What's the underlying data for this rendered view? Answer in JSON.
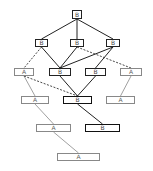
{
  "diagram": {
    "type": "lattice",
    "nodes": [
      {
        "id": "n0",
        "label": "B",
        "kind": "b",
        "x": 72,
        "y": 10,
        "w": 10,
        "h": 9
      },
      {
        "id": "n1",
        "label": "B",
        "kind": "b",
        "x": 35,
        "y": 39,
        "w": 13,
        "h": 8
      },
      {
        "id": "n2",
        "label": "B",
        "kind": "b",
        "x": 70,
        "y": 39,
        "w": 14,
        "h": 8
      },
      {
        "id": "n3",
        "label": "B",
        "kind": "b",
        "x": 106,
        "y": 39,
        "w": 14,
        "h": 8
      },
      {
        "id": "n4",
        "label": "A",
        "kind": "a",
        "x": 14,
        "y": 68,
        "w": 20,
        "h": 8
      },
      {
        "id": "n5",
        "label": "B",
        "kind": "b",
        "x": 49,
        "y": 68,
        "w": 22,
        "h": 8
      },
      {
        "id": "n6",
        "label": "B",
        "kind": "b",
        "x": 85,
        "y": 68,
        "w": 21,
        "h": 8
      },
      {
        "id": "n7",
        "label": "A",
        "kind": "a",
        "x": 120,
        "y": 68,
        "w": 22,
        "h": 8
      },
      {
        "id": "n8",
        "label": "A",
        "kind": "a",
        "x": 21,
        "y": 96,
        "w": 28,
        "h": 8
      },
      {
        "id": "n9",
        "label": "B",
        "kind": "b-bold",
        "x": 63,
        "y": 96,
        "w": 29,
        "h": 8
      },
      {
        "id": "n10",
        "label": "A",
        "kind": "a",
        "x": 106,
        "y": 96,
        "w": 29,
        "h": 8
      },
      {
        "id": "n11",
        "label": "A",
        "kind": "a",
        "x": 36,
        "y": 124,
        "w": 35,
        "h": 8
      },
      {
        "id": "n12",
        "label": "B",
        "kind": "b-bold",
        "x": 85,
        "y": 124,
        "w": 35,
        "h": 8
      },
      {
        "id": "n13",
        "label": "A",
        "kind": "a",
        "x": 57,
        "y": 153,
        "w": 43,
        "h": 8
      }
    ],
    "edges": [
      {
        "from": "n0",
        "to": "n1",
        "style": "solid"
      },
      {
        "from": "n0",
        "to": "n2",
        "style": "solid"
      },
      {
        "from": "n0",
        "to": "n3",
        "style": "solid"
      },
      {
        "from": "n1",
        "to": "n4",
        "style": "dash"
      },
      {
        "from": "n1",
        "to": "n5",
        "style": "solid"
      },
      {
        "from": "n2",
        "to": "n5",
        "style": "solid"
      },
      {
        "from": "n3",
        "to": "n5",
        "style": "solid"
      },
      {
        "from": "n3",
        "to": "n6",
        "style": "solid"
      },
      {
        "from": "n2",
        "to": "n7",
        "style": "dash"
      },
      {
        "from": "n4",
        "to": "n8",
        "style": "light"
      },
      {
        "from": "n4",
        "to": "n9",
        "style": "dash"
      },
      {
        "from": "n5",
        "to": "n9",
        "style": "solid"
      },
      {
        "from": "n6",
        "to": "n9",
        "style": "solid"
      },
      {
        "from": "n7",
        "to": "n10",
        "style": "light"
      },
      {
        "from": "n8",
        "to": "n11",
        "style": "light"
      },
      {
        "from": "n9",
        "to": "n12",
        "style": "solid"
      },
      {
        "from": "n11",
        "to": "n13",
        "style": "light"
      }
    ]
  }
}
